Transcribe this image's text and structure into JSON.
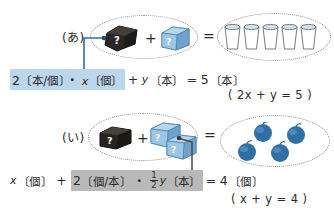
{
  "rows": [
    {
      "label": "(あ)",
      "left_group": {
        "items": [
          "black-box",
          "blue-cube"
        ],
        "operator": "+"
      },
      "relation": "=",
      "right_group": {
        "icon": "cup",
        "count": 5
      },
      "equation": {
        "highlighted": "2〔本/個〕・x〔個〕",
        "highlight_color": "#bcd6ec",
        "rest": "+ y〔本〕= 5〔本〕",
        "parts": {
          "coef": "2",
          "coef_unit": "〔本/個〕",
          "dot": "・",
          "var1": "x",
          "var1_unit": "〔個〕",
          "plus": "+",
          "var2": "y",
          "var2_unit": "〔本〕",
          "equals": "=",
          "result": "5",
          "result_unit": "〔本〕"
        }
      },
      "simplified": "( 2x + y = 5 )"
    },
    {
      "label": "(い)",
      "left_group": {
        "items": [
          "black-box",
          "blue-cube",
          "blue-cube"
        ],
        "operator": "+"
      },
      "relation": "=",
      "right_group": {
        "icon": "berry",
        "count": 4
      },
      "equation": {
        "highlighted": "2〔個/本〕・(1/2) y〔本〕",
        "highlight_color": "#b9b9b9",
        "parts": {
          "var1": "x",
          "var1_unit": "〔個〕",
          "plus": "+",
          "coef": "2",
          "coef_unit": "〔個/本〕",
          "dot": "・",
          "frac_num": "1",
          "frac_den": "2",
          "var2": "y",
          "var2_unit": "〔本〕",
          "equals": "=",
          "result": "4",
          "result_unit": "〔個〕"
        }
      },
      "simplified": "( x + y = 4 )"
    }
  ],
  "icons": {
    "question_mark": "?",
    "black_box_name": "black-box-icon",
    "blue_cube_name": "blue-cube-icon",
    "cup_name": "cup-icon",
    "berry_name": "berry-icon"
  },
  "colors": {
    "highlight_blue": "#bcd6ec",
    "highlight_gray": "#b9b9b9",
    "connector_blue": "#2e6ca4",
    "connector_gray": "#555555",
    "cube_blue": "#7fb2d8",
    "berry_blue": "#2e6ea4",
    "ink": "#2b2b2b"
  }
}
